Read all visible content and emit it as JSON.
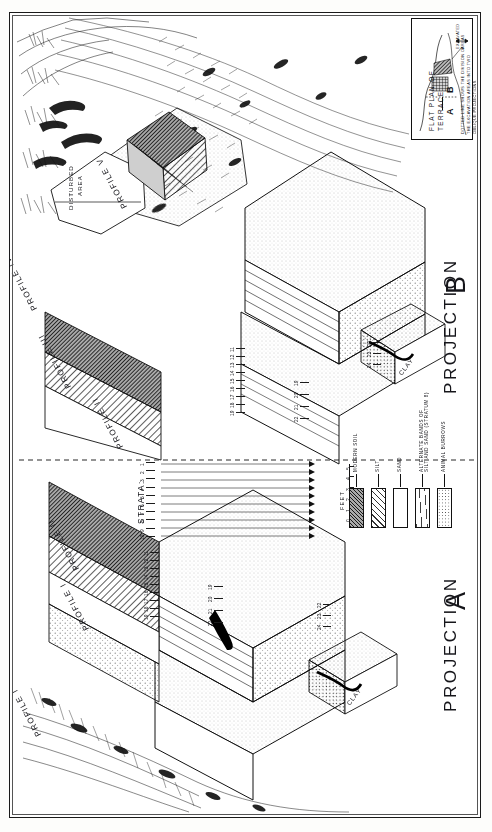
{
  "plate": {
    "projection_a_label": "PROJECTION",
    "projection_a_letter": "A",
    "projection_b_label": "PROJECTION",
    "projection_b_letter": "B"
  },
  "inset": {
    "title_line1": "FLAT PLAN OF",
    "title_line2": "TERRACE",
    "excavated_label_line1": "EXCAVATED",
    "excavated_label_line2": "AREAS",
    "divider_a": "A",
    "divider_b": "B",
    "caption_line1": "DOTTED LINE SHOWS THE DIVISION OF",
    "caption_line2": "THE EXCAVATION AREAS INTO TWO",
    "caption_line3": "OBLIQUE PROJECTIONS"
  },
  "legend": {
    "items": [
      {
        "label": "MODERN SOIL",
        "pattern": "pat-soil"
      },
      {
        "label": "SILT",
        "pattern": "pat-silt"
      },
      {
        "label": "SAND",
        "pattern": "pat-sand"
      },
      {
        "label": "ALTERNATE BANDS OF\nSILT AND SAND (STRATUM 8)",
        "pattern": "pat-alt"
      },
      {
        "label": "ANIMAL BURROWS",
        "pattern": "pat-burrow"
      }
    ],
    "item0": "MODERN SOIL",
    "item1": "SILT",
    "item2": "SAND",
    "item3_line1": "ALTERNATE BANDS OF",
    "item3_line2": "SILT AND SAND (STRATUM 8)",
    "item4": "ANIMAL BURROWS"
  },
  "scale": {
    "unit_label": "FEET",
    "ticks": [
      "0",
      "1",
      "2",
      "3",
      "4",
      "5"
    ]
  },
  "annotations": {
    "disturbed_area_line1": "DISTURBED",
    "disturbed_area_line2": "AREA",
    "strata_label": "STRATA:",
    "clay_a": "CLAY",
    "clay_b": "CLAY"
  },
  "profiles": [
    {
      "name": "PROFILE",
      "numeral": "I"
    },
    {
      "name": "PROFILE",
      "numeral": "II"
    },
    {
      "name": "PROFILE",
      "numeral": "III"
    },
    {
      "name": "PROFILE",
      "numeral": "IV"
    },
    {
      "name": "PROFILE",
      "numeral": "V"
    },
    {
      "name": "PROFILE",
      "numeral": "II"
    },
    {
      "name": "PROFILE",
      "numeral": "I"
    }
  ],
  "profile_labels": {
    "p1a": "PROFILE I",
    "p2a": "PROFILE II",
    "p2b": "PROFILE II",
    "p3": "PROFILE III",
    "p4": "PROFILE IV",
    "p5": "PROFILE V",
    "p1b": "PROFILE I"
  },
  "strata_numbers": {
    "center_column": [
      "1",
      "2",
      "3",
      "4",
      "5",
      "6",
      "7",
      "8",
      "9",
      "10"
    ],
    "proj_a_upper": [
      "11",
      "12",
      "13",
      "14",
      "15",
      "16",
      "17",
      "18",
      "19"
    ],
    "proj_a_lower": [
      "19",
      "20",
      "21",
      "22"
    ],
    "proj_a_block": [
      "22",
      "23",
      "24"
    ],
    "proj_b_upper": [
      "11",
      "12",
      "13",
      "14",
      "15",
      "16",
      "17",
      "18",
      "19"
    ],
    "proj_b_mid": [
      "19",
      "20",
      "21",
      "22"
    ],
    "proj_b_block": [
      "22",
      "23",
      "24"
    ]
  },
  "chart_data": {
    "type": "table",
    "strata_sequence": [
      1,
      2,
      3,
      4,
      5,
      6,
      7,
      8,
      9,
      10,
      11,
      12,
      13,
      14,
      15,
      16,
      17,
      18,
      19,
      20,
      21,
      22,
      23,
      24
    ],
    "materials": [
      "MODERN SOIL",
      "SILT",
      "SAND",
      "ALTERNATE BANDS OF SILT AND SAND (STRATUM 8)",
      "ANIMAL BURROWS",
      "CLAY"
    ],
    "scale_feet": [
      0,
      1,
      2,
      3,
      4,
      5
    ],
    "profiles_shown": [
      "I",
      "II",
      "III",
      "IV",
      "V"
    ]
  }
}
